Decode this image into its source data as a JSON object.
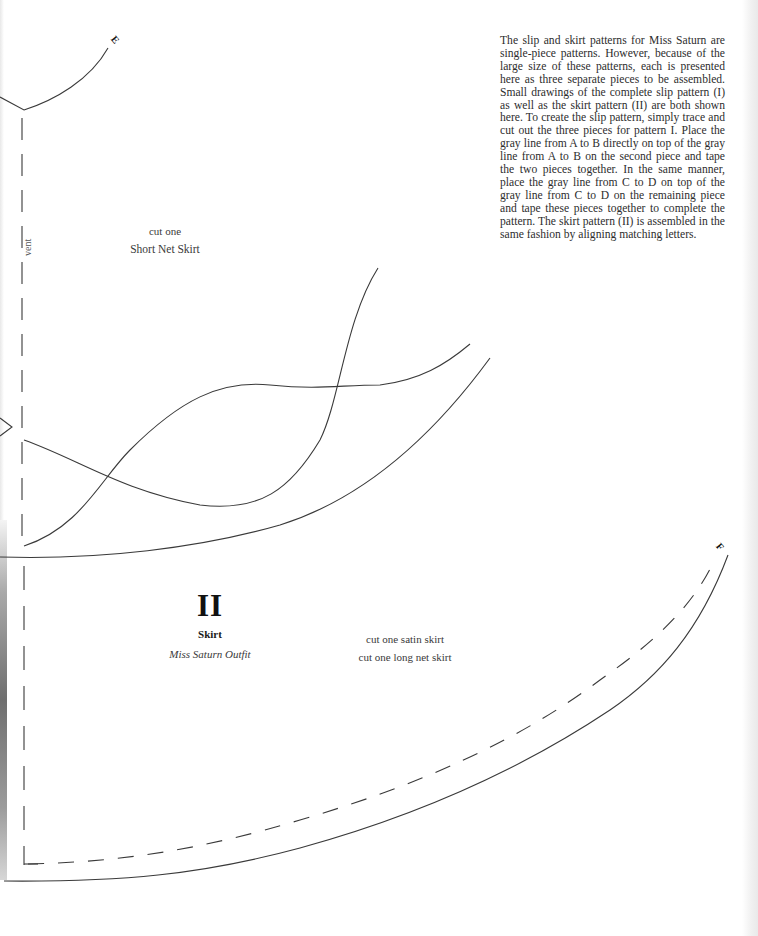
{
  "intro_text": "The slip and skirt patterns for Miss Saturn are single-piece patterns. However, because of the large size of these patterns, each is presented here as three separate pieces to be assembled. Small drawings of the complete slip pattern (I) as well as the skirt pattern (II) are both shown here. To create the slip pattern, simply trace and cut out the three pieces for pattern I. Place the gray line from A to B directly on top of the gray line from A to B on the second piece and tape the two pieces together. In the same manner, place the gray line from C to D on top of the gray line from C to D on the remaining piece and tape these pieces together to complete the pattern. The skirt pattern (II) is assembled in the same fashion by aligning matching letters.",
  "upper_piece": {
    "cut_label": "cut one",
    "piece_name": "Short Net Skirt",
    "vent_label": "vent",
    "corner_letter": "E"
  },
  "lower_piece": {
    "numeral": "II",
    "title": "Skirt",
    "outfit": "Miss Saturn Outfit",
    "cut_instructions": [
      "cut one satin skirt",
      "cut one long net skirt"
    ],
    "corner_letter": "F"
  },
  "colors": {
    "line": "#3a3a3a",
    "text": "#2d2d2d",
    "paper": "#ffffff"
  }
}
